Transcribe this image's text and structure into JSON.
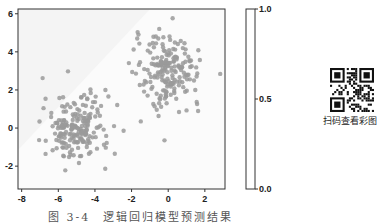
{
  "chart_data": {
    "type": "scatter",
    "title": "",
    "xlabel": "",
    "ylabel": "",
    "xlim": [
      -8.2,
      3.1
    ],
    "ylim": [
      -3.2,
      6.25
    ],
    "xticks": [
      -8,
      -6,
      -4,
      -2,
      0,
      2
    ],
    "yticks": [
      -2,
      0,
      2,
      4,
      6
    ],
    "grid": false,
    "point_color": "#9a9a9a",
    "background_regions": "faint light-gray decision regions (logistic regression prediction)",
    "series": [
      {
        "name": "cluster_1",
        "center": [
          -5.0,
          0.0
        ],
        "spread": [
          0.9,
          0.9
        ],
        "count": 200
      },
      {
        "name": "cluster_2",
        "center": [
          0.0,
          3.0
        ],
        "spread": [
          0.9,
          0.9
        ],
        "count": 200
      }
    ],
    "colorbar": {
      "ticks": [
        "0.0",
        "0.5",
        "1.0"
      ],
      "range": [
        0.0,
        1.0
      ],
      "orientation": "vertical"
    }
  },
  "caption": "图 3-4　逻辑回归模型预测结果",
  "qr": {
    "label": "扫码查看彩图"
  }
}
